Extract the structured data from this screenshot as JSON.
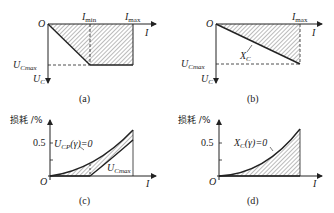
{
  "panels": {
    "a": {
      "caption": "(a)",
      "origin": "O",
      "x_axis": "I",
      "x_mark_min": {
        "main": "I",
        "sub": "min"
      },
      "x_mark_max": {
        "main": "I",
        "sub": "max"
      },
      "y_level": {
        "main": "U",
        "sub": "Cmax"
      },
      "y_axis": {
        "main": "U",
        "sub": "C"
      }
    },
    "b": {
      "caption": "(b)",
      "origin": "O",
      "x_axis": "I",
      "x_mark_max": {
        "main": "I",
        "sub": "max"
      },
      "y_level": {
        "main": "U",
        "sub": "Cmax"
      },
      "y_axis": {
        "main": "U",
        "sub": "C"
      },
      "line_label": {
        "main": "X",
        "sub": "C"
      }
    },
    "c": {
      "caption": "(c)",
      "origin": "O",
      "x_axis": "I",
      "y_axis": "损耗 /%",
      "y_tick": "0.5",
      "curve_upper": {
        "main": "U",
        "sub": "CP",
        "rest": "(γ)=0"
      },
      "curve_lower": {
        "main": "U",
        "sub": "Cmax"
      }
    },
    "d": {
      "caption": "(d)",
      "origin": "O",
      "x_axis": "I",
      "y_axis": "损耗 /%",
      "y_tick": "0.5",
      "curve": {
        "main": "X",
        "sub": "C",
        "rest": "(γ)=0"
      }
    }
  },
  "colors": {
    "line": "#222222",
    "hatch": "#444444",
    "background": "#ffffff"
  }
}
